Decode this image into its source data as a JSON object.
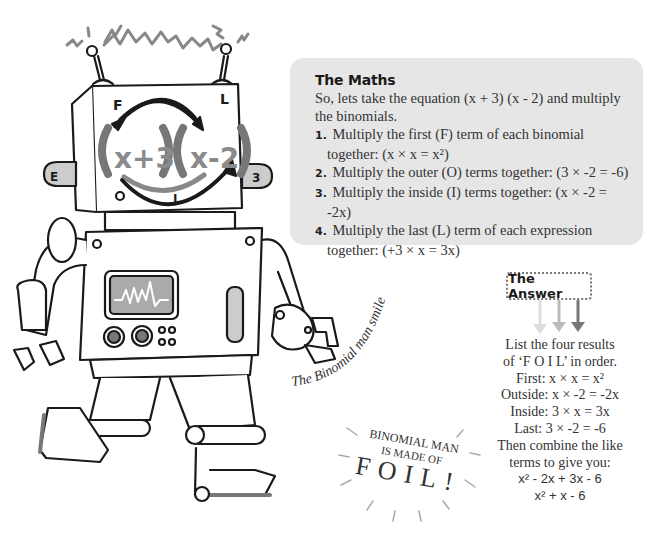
{
  "illustration": {
    "subject": "Binomial man robot",
    "face_labels": {
      "first": "F",
      "last": "L",
      "inside": "I",
      "outside": "O"
    },
    "face_equation": {
      "left_binomial": "x+3",
      "right_binomial": "x-2"
    },
    "ear_left_glyph": "E",
    "ear_right_glyph": "3",
    "accent_grey": "#8a8a8a",
    "dark_grey": "#555555"
  },
  "captions": {
    "curved": "The Binomial man smiles!",
    "burst_line1": "BINOMIAL MAN",
    "burst_line2": "IS MADE OF",
    "burst_line3": "FOIL!"
  },
  "maths_panel": {
    "title": "The Maths",
    "intro": "So, lets take the equation (x + 3) (x - 2) and multiply the binomials.",
    "steps": [
      {
        "num": "1.",
        "text": "Multiply the first (F) term of each binomial together: (x × x = x²)"
      },
      {
        "num": "2.",
        "text": "Multiply the outer (O) terms together: (3 × -2 = -6)"
      },
      {
        "num": "3.",
        "text": "Multiply the inside (I) terms together: (x × -2 = -2x)"
      },
      {
        "num": "4.",
        "text": "Multiply the last (L) term of each expression together: (+3 × x = 3x)"
      }
    ],
    "background": "#e6e6e6"
  },
  "answer": {
    "label": "The Answer",
    "arrow_colors": [
      "#dddddd",
      "#bbbbbb",
      "#777777"
    ],
    "lines": [
      "List the four results",
      "of ‘F O I L’ in order.",
      "First:  x × x = x²",
      "Outside: x × -2 = -2x",
      "Inside: 3 × x = 3x",
      "Last: 3 × -2 = -6",
      "Then combine the like",
      "terms to give you:",
      "x² - 2x + 3x - 6",
      "x² + x - 6"
    ]
  }
}
